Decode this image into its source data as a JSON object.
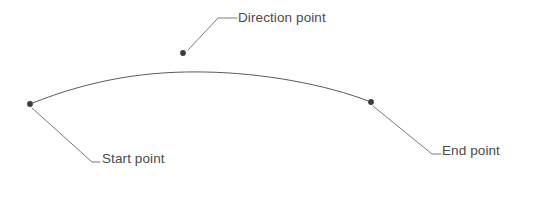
{
  "figure": {
    "background_color": "#ffffff",
    "stroke_color": "#5a5a5a",
    "marker_color": "#3c3c3c",
    "text_color": "#4a4a4a",
    "stroke_width": 1,
    "width": 540,
    "height": 204,
    "curve": {
      "name": "arc-curve",
      "start": [
        30,
        104
      ],
      "end": [
        371,
        102
      ],
      "apex": [
        205,
        72
      ],
      "control_points": [
        [
          100,
          76
        ],
        [
          300,
          70
        ]
      ],
      "path": "M 30 104 C 95 78, 150 71, 205 72 C 262 73, 325 84, 371 102"
    },
    "points": [
      {
        "id": "start-point",
        "label": "Start point",
        "marker": [
          30,
          104
        ],
        "leader": [
          [
            32,
            108
          ],
          [
            92,
            162
          ],
          [
            100,
            162
          ]
        ],
        "label_position": [
          102,
          151
        ]
      },
      {
        "id": "direction-point",
        "label": "Direction point",
        "marker": [
          183,
          53
        ],
        "leader": [
          [
            188,
            50
          ],
          [
            218,
            18
          ],
          [
            237,
            18
          ]
        ],
        "label_position": [
          238,
          10
        ]
      },
      {
        "id": "end-point",
        "label": "End point",
        "marker": [
          371,
          102
        ],
        "leader": [
          [
            373,
            106
          ],
          [
            432,
            154
          ],
          [
            441,
            154
          ]
        ],
        "label_position": [
          442,
          143
        ]
      }
    ]
  }
}
